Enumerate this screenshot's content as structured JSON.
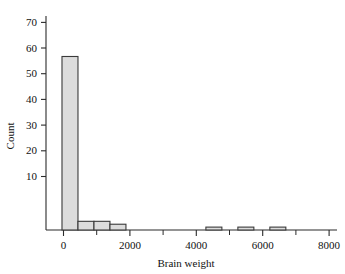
{
  "chart_data": {
    "type": "bar",
    "title": "",
    "subtitle": "",
    "xlabel": "Brain weight",
    "ylabel": "Count",
    "xlim": [
      -500,
      8600
    ],
    "ylim": [
      0,
      74
    ],
    "bin_width": 500,
    "grid": false,
    "legend": false,
    "legend_position": "none",
    "xticks": [
      0,
      2000,
      4000,
      6000,
      8000
    ],
    "xtick_labels": [
      "0",
      "2000",
      "4000",
      "6000",
      "8000"
    ],
    "xminor_ticks": [
      1000,
      3000,
      5000,
      7000
    ],
    "yticks": [
      10,
      20,
      30,
      40,
      50,
      60,
      70
    ],
    "ytick_labels": [
      "10",
      "20",
      "30",
      "40",
      "50",
      "60",
      "70"
    ],
    "bins": [
      {
        "x0": 0,
        "x1": 500,
        "value": 60
      },
      {
        "x0": 500,
        "x1": 1000,
        "value": 3
      },
      {
        "x0": 1000,
        "x1": 1500,
        "value": 3
      },
      {
        "x0": 1500,
        "x1": 2000,
        "value": 2
      },
      {
        "x0": 4500,
        "x1": 5000,
        "value": 1
      },
      {
        "x0": 5500,
        "x1": 6000,
        "value": 1
      },
      {
        "x0": 6500,
        "x1": 7000,
        "value": 1
      }
    ],
    "categories": [
      "0-500",
      "500-1000",
      "1000-1500",
      "1500-2000",
      "4500-5000",
      "5500-6000",
      "6500-7000"
    ],
    "values": [
      60,
      3,
      3,
      2,
      1,
      1,
      1
    ],
    "colors": {
      "bar_fill": "#dcdcdc",
      "bar_edge": "#3a3a3a",
      "axis": "#2b2b2b",
      "text": "#111111",
      "background": "#ffffff"
    }
  }
}
